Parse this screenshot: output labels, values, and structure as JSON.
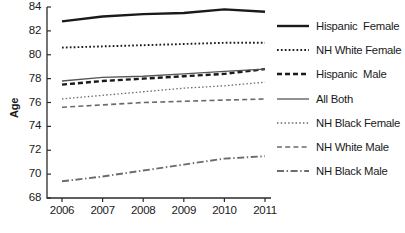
{
  "chart_data": {
    "type": "line",
    "title": "",
    "xlabel": "",
    "ylabel": "Age",
    "x": [
      2006,
      2007,
      2008,
      2009,
      2010,
      2011
    ],
    "categories": [
      "2006",
      "2007",
      "2008",
      "2009",
      "2010",
      "2011"
    ],
    "ylim": [
      68,
      84
    ],
    "xlim": [
      2006,
      2011
    ],
    "yticks": [
      68,
      70,
      72,
      74,
      76,
      78,
      80,
      82,
      84
    ],
    "ytick_labels": [
      "68",
      "70",
      "72",
      "74",
      "76",
      "78",
      "80",
      "82",
      "84"
    ],
    "grid": false,
    "legend_position": "right",
    "series": [
      {
        "name": "Hispanic  Female",
        "style": "solid-thick",
        "color": "#1a1a1a",
        "values": [
          82.8,
          83.2,
          83.4,
          83.5,
          83.8,
          83.6
        ]
      },
      {
        "name": "NH White Female",
        "style": "dotted",
        "color": "#1a1a1a",
        "values": [
          80.6,
          80.7,
          80.8,
          80.9,
          81.0,
          81.0
        ]
      },
      {
        "name": "Hispanic  Male",
        "style": "dashed-thick",
        "color": "#1a1a1a",
        "values": [
          77.5,
          77.8,
          78.0,
          78.2,
          78.4,
          78.8
        ]
      },
      {
        "name": "All Both",
        "style": "solid-thin",
        "color": "#555555",
        "values": [
          77.8,
          78.1,
          78.2,
          78.4,
          78.6,
          78.8
        ]
      },
      {
        "name": "NH Black Female",
        "style": "dotted-fine",
        "color": "#6b6b6b",
        "values": [
          76.3,
          76.6,
          76.9,
          77.2,
          77.4,
          77.7
        ]
      },
      {
        "name": "NH White Male",
        "style": "dashed",
        "color": "#6b6b6b",
        "values": [
          75.6,
          75.8,
          76.0,
          76.1,
          76.2,
          76.3
        ]
      },
      {
        "name": "NH Black Male",
        "style": "dash-dot",
        "color": "#6b6b6b",
        "values": [
          69.4,
          69.8,
          70.3,
          70.8,
          71.3,
          71.5
        ]
      }
    ]
  },
  "legend": {
    "items": [
      {
        "label": "Hispanic  Female"
      },
      {
        "label": "NH White Female"
      },
      {
        "label": "Hispanic  Male"
      },
      {
        "label": "All Both"
      },
      {
        "label": "NH Black Female"
      },
      {
        "label": "NH White Male"
      },
      {
        "label": "NH Black Male"
      }
    ]
  }
}
